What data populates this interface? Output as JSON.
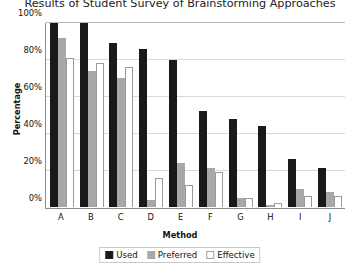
{
  "chart_data": {
    "type": "bar",
    "title": "Results of Student Survey of Brainstorming Approaches",
    "xlabel": "Method",
    "ylabel": "Percentage",
    "categories": [
      "A",
      "B",
      "C",
      "D",
      "E",
      "F",
      "G",
      "H",
      "I",
      "J"
    ],
    "ylim": [
      0,
      100
    ],
    "yticks": [
      "0%",
      "20%",
      "40%",
      "60%",
      "80%",
      "100%"
    ],
    "ytick_values": [
      0,
      20,
      40,
      60,
      80,
      100
    ],
    "grid": true,
    "legend_position": "bottom",
    "series": [
      {
        "name": "Used",
        "color": "#1a1a1a",
        "values": [
          100,
          100,
          89,
          86,
          80,
          52,
          48,
          44,
          26,
          21
        ]
      },
      {
        "name": "Preferred",
        "color": "#a8a8a8",
        "values": [
          92,
          74,
          70,
          4,
          24,
          21,
          5,
          1,
          10,
          8
        ]
      },
      {
        "name": "Effective",
        "color": "#ffffff",
        "values": [
          81,
          78,
          76,
          16,
          12,
          19,
          5,
          2,
          6,
          6
        ]
      }
    ]
  }
}
